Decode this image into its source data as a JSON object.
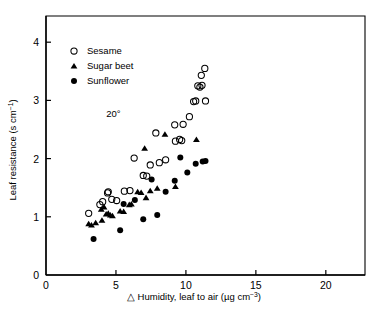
{
  "chart_data": {
    "type": "scatter",
    "title": "",
    "xlabel": "△ Humidity, leaf to air (µg cm−3)",
    "xlabel_main": "△ Humidity, leaf to air (µg cm",
    "xlabel_sup": "−3",
    "xlabel_tail": ")",
    "ylabel": "Leaf resistance (s cm−1)",
    "ylabel_main": "Leaf resistance (s cm",
    "ylabel_sup": "−1",
    "ylabel_tail": ")",
    "xlim": [
      0,
      22.8
    ],
    "ylim": [
      0,
      4.45
    ],
    "xticks": [
      0,
      5,
      10,
      15,
      20
    ],
    "xtick_labels": [
      "0",
      "5",
      "10",
      "15",
      "20"
    ],
    "yticks": [
      0,
      1,
      2,
      3,
      4
    ],
    "ytick_labels": [
      "0",
      "1",
      "2",
      "3",
      "4"
    ],
    "grid": false,
    "legend_position": "upper-left",
    "annotations": [
      {
        "text": "20°",
        "x": 4.3,
        "y": 2.72
      }
    ],
    "series": [
      {
        "name": "Sesame",
        "marker": "open-circle",
        "color": "#000000",
        "points": [
          [
            3.05,
            1.06
          ],
          [
            3.85,
            1.21
          ],
          [
            4.05,
            1.26
          ],
          [
            4.4,
            1.41
          ],
          [
            4.45,
            1.43
          ],
          [
            4.7,
            1.3
          ],
          [
            5.05,
            1.28
          ],
          [
            5.6,
            1.44
          ],
          [
            6.0,
            1.45
          ],
          [
            6.3,
            2.01
          ],
          [
            6.95,
            1.71
          ],
          [
            7.2,
            1.7
          ],
          [
            7.45,
            1.89
          ],
          [
            7.85,
            2.44
          ],
          [
            8.1,
            1.93
          ],
          [
            8.55,
            1.98
          ],
          [
            9.2,
            2.58
          ],
          [
            9.25,
            2.3
          ],
          [
            9.55,
            2.33
          ],
          [
            9.7,
            2.31
          ],
          [
            9.8,
            2.59
          ],
          [
            10.25,
            2.72
          ],
          [
            10.55,
            2.98
          ],
          [
            10.7,
            2.99
          ],
          [
            10.85,
            3.25
          ],
          [
            11.0,
            3.23
          ],
          [
            11.1,
            3.43
          ],
          [
            11.15,
            3.26
          ],
          [
            11.35,
            3.55
          ],
          [
            11.4,
            2.99
          ]
        ]
      },
      {
        "name": "Sugar beet",
        "marker": "filled-triangle",
        "color": "#000000",
        "points": [
          [
            3.05,
            0.88
          ],
          [
            3.25,
            0.86
          ],
          [
            3.55,
            0.9
          ],
          [
            3.95,
            1.13
          ],
          [
            4.15,
            1.17
          ],
          [
            4.3,
            1.05
          ],
          [
            4.45,
            1.06
          ],
          [
            4.6,
            1.03
          ],
          [
            4.75,
            1.02
          ],
          [
            4.0,
            0.94
          ],
          [
            5.3,
            1.1
          ],
          [
            5.55,
            1.09
          ],
          [
            5.95,
            1.21
          ],
          [
            6.1,
            1.22
          ],
          [
            6.55,
            1.43
          ],
          [
            6.8,
            1.42
          ],
          [
            7.05,
            2.18
          ],
          [
            7.15,
            1.33
          ],
          [
            7.45,
            1.45
          ],
          [
            7.95,
            1.49
          ],
          [
            8.5,
            2.42
          ],
          [
            9.25,
            1.52
          ],
          [
            10.75,
            2.33
          ]
        ]
      },
      {
        "name": "Sunflower",
        "marker": "filled-circle",
        "color": "#000000",
        "points": [
          [
            3.4,
            0.62
          ],
          [
            5.3,
            0.77
          ],
          [
            5.55,
            1.22
          ],
          [
            6.35,
            1.29
          ],
          [
            6.95,
            0.96
          ],
          [
            7.55,
            1.64
          ],
          [
            7.95,
            1.03
          ],
          [
            8.55,
            1.43
          ],
          [
            9.2,
            1.62
          ],
          [
            9.6,
            2.02
          ],
          [
            10.1,
            1.76
          ],
          [
            10.7,
            1.91
          ],
          [
            11.2,
            1.95
          ],
          [
            11.4,
            1.96
          ]
        ]
      }
    ]
  },
  "legend": {
    "items": [
      {
        "label": "Sesame",
        "marker": "open-circle"
      },
      {
        "label": "Sugar beet",
        "marker": "filled-triangle"
      },
      {
        "label": "Sunflower",
        "marker": "filled-circle"
      }
    ]
  }
}
